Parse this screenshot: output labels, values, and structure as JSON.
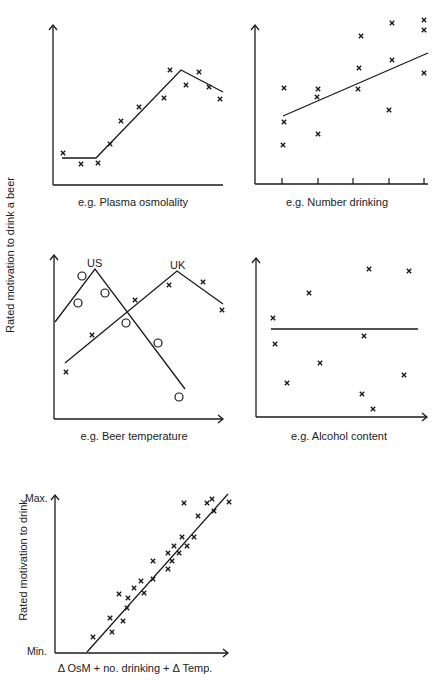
{
  "figure": {
    "shared_ylabel": "Rated motivation to drink a beer"
  },
  "chart_data": [
    {
      "type": "scatter",
      "id": "panel-plasma",
      "xlabel": "e.g. Plasma osmolality",
      "ylabel": "Rated motivation to drink a beer",
      "axes": {
        "origin": [
          53,
          185
        ],
        "x_end": 223,
        "y_top": 25,
        "x_arrow": false,
        "y_arrow": true
      },
      "points": [
        [
          63,
          153
        ],
        [
          81,
          164
        ],
        [
          98,
          163
        ],
        [
          110,
          144
        ],
        [
          121,
          121
        ],
        [
          139,
          107
        ],
        [
          164,
          98
        ],
        [
          170,
          70
        ],
        [
          186,
          85
        ],
        [
          199,
          72
        ],
        [
          209,
          87
        ],
        [
          220,
          99
        ]
      ],
      "fit_lines": [
        {
          "points": [
            [
              62,
              158
            ],
            [
              96,
              158
            ],
            [
              181,
              70
            ],
            [
              223,
              92
            ]
          ]
        }
      ],
      "description": "Flat at low osmolality, rises linearly, peaks then declines slightly"
    },
    {
      "type": "scatter",
      "id": "panel-number-drinking",
      "xlabel": "e.g. Number drinking",
      "axes": {
        "origin": [
          255,
          184
        ],
        "x_end": 428,
        "y_top": 25,
        "x_arrow": false,
        "y_arrow": true
      },
      "ticks_x": [
        282,
        318,
        353,
        389,
        424
      ],
      "points": [
        [
          284,
          88
        ],
        [
          284,
          122
        ],
        [
          283,
          145
        ],
        [
          318,
          89
        ],
        [
          317,
          97
        ],
        [
          318,
          134
        ],
        [
          361,
          36
        ],
        [
          359,
          68
        ],
        [
          358,
          89
        ],
        [
          392,
          23
        ],
        [
          392,
          60
        ],
        [
          389,
          110
        ],
        [
          424,
          20
        ],
        [
          424,
          30
        ],
        [
          424,
          73
        ]
      ],
      "fit_lines": [
        {
          "points": [
            [
              283,
              116
            ],
            [
              428,
              53
            ]
          ]
        }
      ],
      "description": "Positive linear trend with wide scatter"
    },
    {
      "type": "scatter",
      "id": "panel-beer-temperature",
      "xlabel": "e.g. Beer temperature",
      "axes": {
        "origin": [
          54,
          419
        ],
        "x_end": 223,
        "y_top": 255,
        "x_arrow": true,
        "y_arrow": true
      },
      "series": [
        {
          "name": "US",
          "marker": "circle",
          "label_pos": [
            95,
            264
          ],
          "points": [
            [
              82,
              276
            ],
            [
              78,
              303
            ],
            [
              105,
              293
            ],
            [
              126,
              323
            ],
            [
              158,
              343
            ],
            [
              179,
              397
            ]
          ],
          "line": [
            [
              55,
              322
            ],
            [
              95,
              269
            ],
            [
              185,
              389
            ]
          ]
        },
        {
          "name": "UK",
          "marker": "cross",
          "label_pos": [
            177,
            266
          ],
          "points": [
            [
              66,
              372
            ],
            [
              92,
              335
            ],
            [
              135,
              300
            ],
            [
              169,
              285
            ],
            [
              203,
              282
            ],
            [
              222,
              310
            ]
          ],
          "line": [
            [
              65,
              363
            ],
            [
              177,
              271
            ],
            [
              223,
              304
            ]
          ]
        }
      ],
      "description": "US preference peaks at cold temperature; UK preference peaks at warmer temperature"
    },
    {
      "type": "scatter",
      "id": "panel-alcohol-content",
      "xlabel": "e.g. Alcohol content",
      "axes": {
        "origin": [
          256,
          417
        ],
        "x_end": 427,
        "y_top": 258,
        "x_arrow": true,
        "y_arrow": true
      },
      "points": [
        [
          273,
          318
        ],
        [
          275,
          344
        ],
        [
          287,
          383
        ],
        [
          309,
          293
        ],
        [
          320,
          363
        ],
        [
          369,
          269
        ],
        [
          364,
          336
        ],
        [
          362,
          394
        ],
        [
          373,
          409
        ],
        [
          409,
          271
        ],
        [
          404,
          375
        ]
      ],
      "fit_lines": [
        {
          "points": [
            [
              271,
              329
            ],
            [
              418,
              329
            ]
          ]
        }
      ],
      "description": "No relationship — flat line through random scatter"
    },
    {
      "type": "scatter",
      "id": "panel-combined",
      "xlabel": "Δ OsM + no. drinking + Δ Temp.",
      "ylabel": "Rated motivation to drink",
      "y_tick_labels": {
        "max": "Max.",
        "min": "Min."
      },
      "axes": {
        "origin": [
          55,
          653
        ],
        "x_end": 228,
        "y_top": 495,
        "x_arrow": true,
        "y_arrow": true
      },
      "points": [
        [
          93,
          637
        ],
        [
          110,
          618
        ],
        [
          112,
          632
        ],
        [
          123,
          621
        ],
        [
          119,
          594
        ],
        [
          128,
          598
        ],
        [
          127,
          608
        ],
        [
          134,
          588
        ],
        [
          141,
          581
        ],
        [
          144,
          593
        ],
        [
          153,
          561
        ],
        [
          153,
          579
        ],
        [
          168,
          569
        ],
        [
          168,
          553
        ],
        [
          172,
          561
        ],
        [
          174,
          546
        ],
        [
          179,
          553
        ],
        [
          182,
          537
        ],
        [
          187,
          546
        ],
        [
          194,
          537
        ],
        [
          184,
          503
        ],
        [
          198,
          516
        ],
        [
          207,
          503
        ],
        [
          212,
          499
        ],
        [
          214,
          511
        ],
        [
          229,
          502
        ]
      ],
      "fit_lines": [
        {
          "points": [
            [
              87,
              652
            ],
            [
              228,
              494
            ]
          ]
        }
      ],
      "description": "Strong positive linear relationship when factors combined"
    }
  ],
  "labels": {
    "p1_x": "e.g. Plasma osmolality",
    "p2_x": "e.g. Number drinking",
    "p3_x": "e.g. Beer temperature",
    "p4_x": "e.g. Alcohol content",
    "p5_x": "Δ OsM + no. drinking + Δ Temp.",
    "p5_y": "Rated motivation to drink",
    "p5_max": "Max.",
    "p5_min": "Min.",
    "us": "US",
    "uk": "UK"
  },
  "style": {
    "ink": "#1a1a1a",
    "background": "#ffffff"
  }
}
